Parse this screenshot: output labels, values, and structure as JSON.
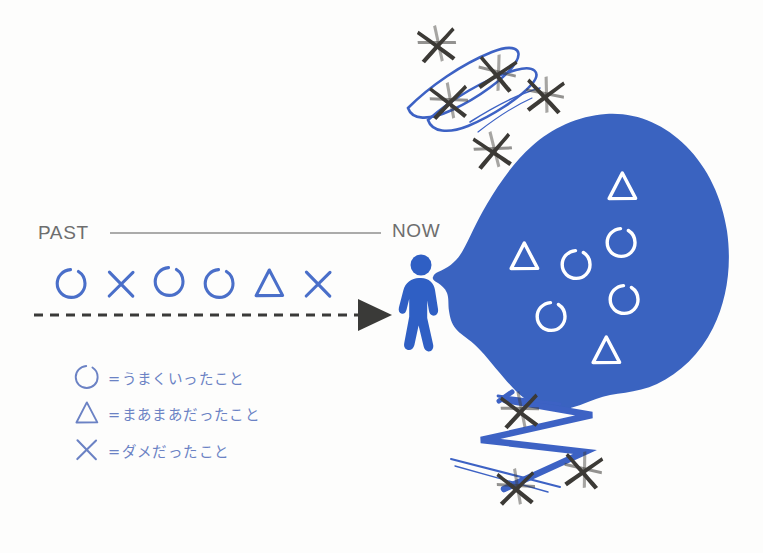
{
  "page": {
    "background_color": "#fdfdfc"
  },
  "timeline": {
    "past_label": "PAST",
    "now_label": "NOW",
    "rule_color": "#8f8f8f",
    "label_color": "#6e6e6e",
    "arrow_color": "#3a3a38",
    "symbol_color": "#4a6fc9",
    "sequence": [
      {
        "kind": "circle",
        "meaning": "went-well"
      },
      {
        "kind": "cross",
        "meaning": "was-bad"
      },
      {
        "kind": "circle",
        "meaning": "went-well"
      },
      {
        "kind": "circle",
        "meaning": "went-well"
      },
      {
        "kind": "triangle",
        "meaning": "so-so"
      },
      {
        "kind": "cross",
        "meaning": "was-bad"
      }
    ]
  },
  "legend": {
    "symbol_color": "#6b82c4",
    "text_color": "#6b82c4",
    "items": [
      {
        "glyph": "circle-icon",
        "text": "=うまくいったこと"
      },
      {
        "glyph": "triangle-icon",
        "text": "=まあまあだったこと"
      },
      {
        "glyph": "cross-icon",
        "text": "=ダメだったこと"
      }
    ]
  },
  "figure": {
    "name": "walking-person-pictogram",
    "color": "#2f5fc4"
  },
  "blob": {
    "name": "future-blob",
    "fill_color": "#3a63c0",
    "symbol_color": "#ffffff",
    "contents": [
      {
        "kind": "triangle",
        "meaning": "so-so"
      },
      {
        "kind": "circle",
        "meaning": "went-well"
      },
      {
        "kind": "triangle",
        "meaning": "so-so"
      },
      {
        "kind": "circle",
        "meaning": "went-well"
      },
      {
        "kind": "circle",
        "meaning": "went-well"
      },
      {
        "kind": "circle",
        "meaning": "went-well"
      },
      {
        "kind": "triangle",
        "meaning": "so-so"
      }
    ],
    "circle_count": 4,
    "triangle_count": 3
  },
  "scribble_clusters": [
    {
      "name": "top-discard-cluster",
      "position": "top",
      "cross_color": "#3c3a36",
      "scribble_color": "#3d62c4",
      "cross_count": 5,
      "scribble_style": "loops"
    },
    {
      "name": "bottom-discard-cluster",
      "position": "bottom",
      "cross_color": "#3c3a36",
      "scribble_color": "#3d62c4",
      "cross_count": 3,
      "scribble_style": "zigzag"
    }
  ]
}
